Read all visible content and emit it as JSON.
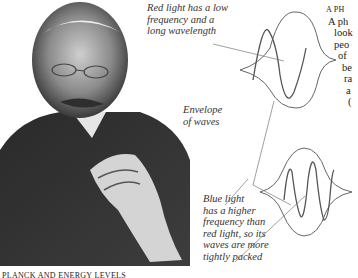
{
  "photo": {
    "subject": "portrait-of-elderly-man-with-glasses-and-moustache"
  },
  "labels": {
    "red": [
      "Red light has a low",
      "frequency and a",
      "long wavelength"
    ],
    "envelope": [
      "Envelope",
      "of waves"
    ],
    "blue": [
      "Blue light",
      "has a higher",
      "frequency than",
      "red light, so its",
      "waves are more",
      "tightly packed"
    ]
  },
  "sidebar": {
    "heading": "A PH",
    "lines": [
      "A ph",
      "look",
      "peo",
      "of",
      "be",
      "ra",
      "a",
      "("
    ]
  },
  "caption": "PLANCK AND ENERGY LEVELS",
  "colors": {
    "line": "#555555",
    "text": "#333333"
  }
}
